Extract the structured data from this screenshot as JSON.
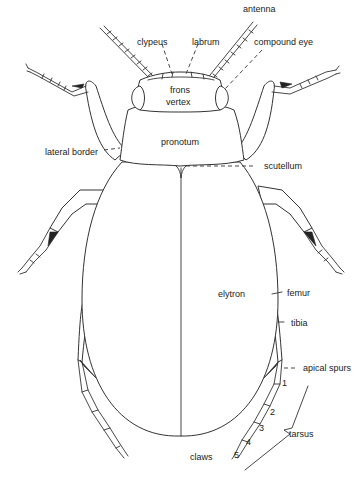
{
  "diagram": {
    "labels": {
      "antenna": "antenna",
      "clypeus": "clypeus",
      "labrum": "labrum",
      "compound_eye": "compound eye",
      "frons": "frons",
      "vertex": "vertex",
      "pronotum": "pronotum",
      "lateral_border": "lateral border",
      "scutellum": "scutellum",
      "elytron": "elytron",
      "femur": "femur",
      "tibia": "tibia",
      "apical_spurs": "apical spurs",
      "tarsus": "tarsus",
      "claws": "claws"
    },
    "tarsal_segments": [
      "1",
      "2",
      "3",
      "4",
      "5"
    ]
  }
}
